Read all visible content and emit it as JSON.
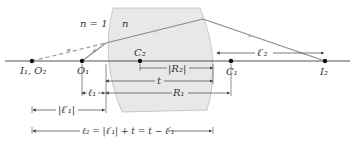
{
  "diagram": {
    "colors": {
      "lens_fill": "#e6e6e6",
      "axis": "#555555",
      "ray": "#8a8a8a",
      "text": "#333333"
    },
    "media": {
      "outside": "n = 1",
      "lens": "n"
    },
    "points": [
      {
        "id": "I1O2",
        "label": "I₁, O₂",
        "x": 32
      },
      {
        "id": "O1",
        "label": "O₁",
        "x": 82
      },
      {
        "id": "C2",
        "label": "C₂",
        "x": 140
      },
      {
        "id": "C1",
        "label": "C₁",
        "x": 231
      },
      {
        "id": "I2",
        "label": "I₂",
        "x": 325
      }
    ],
    "dimensions": {
      "ell2_prime": "ℓ′₂",
      "R2": "|R₂|",
      "t": "t",
      "ell1": "ℓ₁",
      "R1": "R₁",
      "ell1_prime": "|ℓ′₁|",
      "ell2_eq": "ℓ₂ = |ℓ′₁| + t = t − ℓ′₁"
    }
  }
}
